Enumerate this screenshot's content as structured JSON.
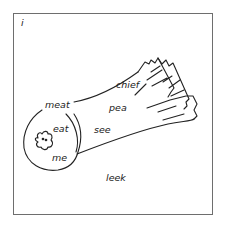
{
  "card": {
    "corner_letter": "i",
    "subject": "leek",
    "words": {
      "meat": "meat",
      "chief": "chief",
      "pea": "pea",
      "eat": "eat",
      "see": "see",
      "me": "me",
      "leek": "leek"
    },
    "colors": {
      "ink": "#222222",
      "frame": "#6e6e6e",
      "background": "#ffffff"
    }
  }
}
